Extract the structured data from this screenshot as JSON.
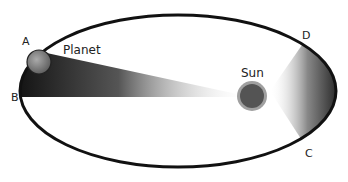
{
  "diagram": {
    "labels": {
      "a": "A",
      "b": "B",
      "c": "C",
      "d": "D",
      "planet": "Planet",
      "sun": "Sun"
    },
    "colors": {
      "orbit": "#111111",
      "sun_core": "#555555",
      "sun_halo": "#9a9a9a",
      "planet": "#777777",
      "sweep_dark": "#111111"
    }
  }
}
